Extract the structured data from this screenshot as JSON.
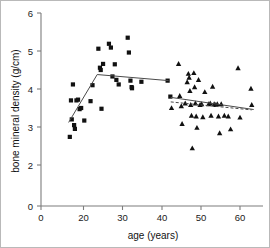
{
  "chart_data": {
    "type": "scatter",
    "title": "",
    "xlabel": "age (years)",
    "ylabel": "bone mineral density (g/cm)",
    "xlim": [
      14,
      65
    ],
    "ylim": [
      0,
      6
    ],
    "grid": false,
    "legend": "none",
    "xticks": [
      0,
      20,
      30,
      40,
      50,
      60
    ],
    "xticklabels": [
      "0",
      "20",
      "30",
      "40",
      "50",
      "60"
    ],
    "yticks": [
      0,
      2,
      3,
      4,
      5,
      6
    ],
    "yticklabels": [
      "0",
      "2",
      "3",
      "4",
      "5",
      "6"
    ],
    "series": [
      {
        "name": "younger group (squares)",
        "marker": "square",
        "color": "#111111",
        "points": [
          [
            16.5,
            2.74
          ],
          [
            16.8,
            3.7
          ],
          [
            17.0,
            3.2
          ],
          [
            17.3,
            4.12
          ],
          [
            17.6,
            3.05
          ],
          [
            17.8,
            2.95
          ],
          [
            18.2,
            3.7
          ],
          [
            18.6,
            3.72
          ],
          [
            19.0,
            3.47
          ],
          [
            19.4,
            3.5
          ],
          [
            20.2,
            3.17
          ],
          [
            21.8,
            3.68
          ],
          [
            22.3,
            4.1
          ],
          [
            23.8,
            5.06
          ],
          [
            24.2,
            4.56
          ],
          [
            24.4,
            4.5
          ],
          [
            24.6,
            3.48
          ],
          [
            25.0,
            4.66
          ],
          [
            26.5,
            5.19
          ],
          [
            27.0,
            5.09
          ],
          [
            27.4,
            4.33
          ],
          [
            28.0,
            4.65
          ],
          [
            28.4,
            4.24
          ],
          [
            29.0,
            4.12
          ],
          [
            31.3,
            5.35
          ],
          [
            31.6,
            4.96
          ],
          [
            32.0,
            4.22
          ],
          [
            32.3,
            4.05
          ],
          [
            32.4,
            4.02
          ],
          [
            34.8,
            4.19
          ],
          [
            41.5,
            4.22
          ],
          [
            42.2,
            3.8
          ]
        ]
      },
      {
        "name": "older group (triangles)",
        "marker": "triangle",
        "color": "#111111",
        "points": [
          [
            42.5,
            3.5
          ],
          [
            44.3,
            4.66
          ],
          [
            44.6,
            3.82
          ],
          [
            45.0,
            3.55
          ],
          [
            45.2,
            3.08
          ],
          [
            46.0,
            3.62
          ],
          [
            46.5,
            4.18
          ],
          [
            46.8,
            4.4
          ],
          [
            47.0,
            4.3
          ],
          [
            47.2,
            3.95
          ],
          [
            47.4,
            3.58
          ],
          [
            47.6,
            3.3
          ],
          [
            47.8,
            2.44
          ],
          [
            48.2,
            4.42
          ],
          [
            48.4,
            4.05
          ],
          [
            48.6,
            3.62
          ],
          [
            48.8,
            3.28
          ],
          [
            49.0,
            2.98
          ],
          [
            49.4,
            4.24
          ],
          [
            49.8,
            3.58
          ],
          [
            50.2,
            3.6
          ],
          [
            50.5,
            3.26
          ],
          [
            51.0,
            3.92
          ],
          [
            52.0,
            3.6
          ],
          [
            52.4,
            3.62
          ],
          [
            52.6,
            3.3
          ],
          [
            53.0,
            4.06
          ],
          [
            53.4,
            3.6
          ],
          [
            53.8,
            3.58
          ],
          [
            54.2,
            3.6
          ],
          [
            54.5,
            3.28
          ],
          [
            54.8,
            2.84
          ],
          [
            55.2,
            3.6
          ],
          [
            56.0,
            3.3
          ],
          [
            57.0,
            3.28
          ],
          [
            57.6,
            2.94
          ],
          [
            59.5,
            4.55
          ],
          [
            60.0,
            3.25
          ],
          [
            62.8,
            4.01
          ],
          [
            63.0,
            3.58
          ]
        ]
      }
    ],
    "trend_lines": [
      {
        "name": "younger-group-fit",
        "style": "solid",
        "points": [
          [
            16.2,
            3.12
          ],
          [
            23.5,
            4.38
          ],
          [
            41.8,
            4.22
          ]
        ]
      },
      {
        "name": "older-group-fit-solid",
        "style": "solid",
        "points": [
          [
            42.3,
            3.78
          ],
          [
            63.5,
            3.46
          ]
        ]
      },
      {
        "name": "older-group-fit-dashed",
        "style": "dashed",
        "points": [
          [
            42.3,
            3.66
          ],
          [
            63.0,
            3.45
          ]
        ]
      }
    ]
  }
}
